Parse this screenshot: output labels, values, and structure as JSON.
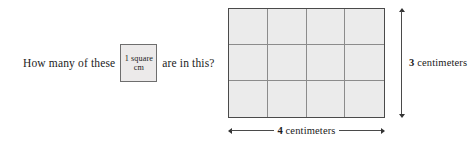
{
  "figure": {
    "question": {
      "text_before": "How many of these",
      "unit_label_line1": "1 square",
      "unit_label_line2": "cm",
      "text_after": "are in this?"
    },
    "grid": {
      "columns": 4,
      "rows": 3,
      "total_cells": 12,
      "fill_color": "#ebebeb",
      "line_color": "#8b8b8b",
      "border_color": "#4a4a4a"
    },
    "dimensions": {
      "height_value": "3",
      "height_unit": "centimeters",
      "width_value": "4",
      "width_unit": "centimeters"
    }
  }
}
